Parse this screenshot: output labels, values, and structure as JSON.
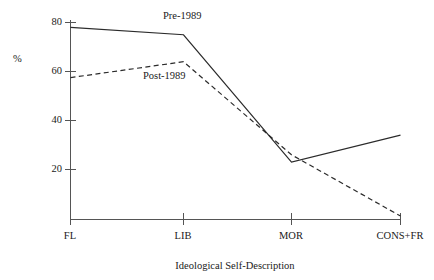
{
  "chart_data": {
    "type": "line",
    "title": "",
    "xlabel": "Ideological Self-Description",
    "ylabel": "%",
    "categories": [
      "FL",
      "LIB",
      "MOR",
      "CONS+FR"
    ],
    "ylim": [
      0,
      84
    ],
    "yticks": [
      20,
      40,
      60,
      80
    ],
    "ytick_labels": [
      "20",
      "40",
      "60",
      "80"
    ],
    "grid": false,
    "legend_position": "inline-annotations",
    "series": [
      {
        "name": "Pre-1989",
        "style": "solid",
        "color": "#2b2b2b",
        "values": [
          78,
          75,
          23,
          34
        ]
      },
      {
        "name": "Post-1989",
        "style": "dashed",
        "color": "#2b2b2b",
        "values": [
          57.5,
          64,
          26,
          1
        ]
      }
    ],
    "annotations": [
      {
        "text": "Pre-1989",
        "x_px": 163,
        "y_px": 11
      },
      {
        "text": "Post-1989",
        "x_px": 143,
        "y_px": 71
      }
    ]
  },
  "axes": {
    "y_title": "%",
    "x_title": "Ideological Self-Description",
    "y_tick_labels": [
      "80",
      "60",
      "40",
      "20"
    ],
    "x_tick_labels": [
      "FL",
      "LIB",
      "MOR",
      "CONS+FR"
    ]
  },
  "colors": {
    "line": "#2b2b2b",
    "axis": "#555555",
    "background": "#ffffff",
    "text": "#1a1a1a"
  }
}
